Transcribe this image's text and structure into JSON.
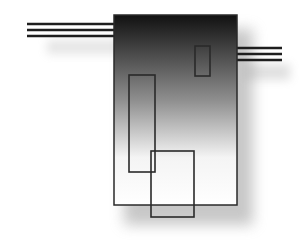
{
  "diagram": {
    "background": "#ffffff",
    "main_block": {
      "x": 114,
      "y": 15,
      "width": 123,
      "height": 190,
      "stroke": "#2a2a2a",
      "gradient": [
        {
          "offset": "0%",
          "color": "#111111"
        },
        {
          "offset": "45%",
          "color": "#8f8f8f"
        },
        {
          "offset": "75%",
          "color": "#f4f4f4"
        },
        {
          "offset": "100%",
          "color": "#ffffff"
        }
      ],
      "shadow_color": "#9a9a9a"
    },
    "left_lines": {
      "x1": 27,
      "x2": 114,
      "ys": [
        24,
        30,
        36
      ],
      "stroke": "#1e1e1e",
      "width": 2.5
    },
    "right_lines": {
      "x1": 237,
      "x2": 282,
      "ys": [
        48,
        54,
        60
      ],
      "stroke": "#1e1e1e",
      "width": 2.5
    },
    "inner_rects": [
      {
        "name": "small-rect",
        "x": 195,
        "y": 46,
        "width": 15,
        "height": 30
      },
      {
        "name": "tall-rect",
        "x": 129,
        "y": 75,
        "width": 26,
        "height": 97
      },
      {
        "name": "overlap-rect",
        "x": 151,
        "y": 151,
        "width": 43,
        "height": 66
      }
    ],
    "inner_stroke": "#2a2a2a"
  }
}
